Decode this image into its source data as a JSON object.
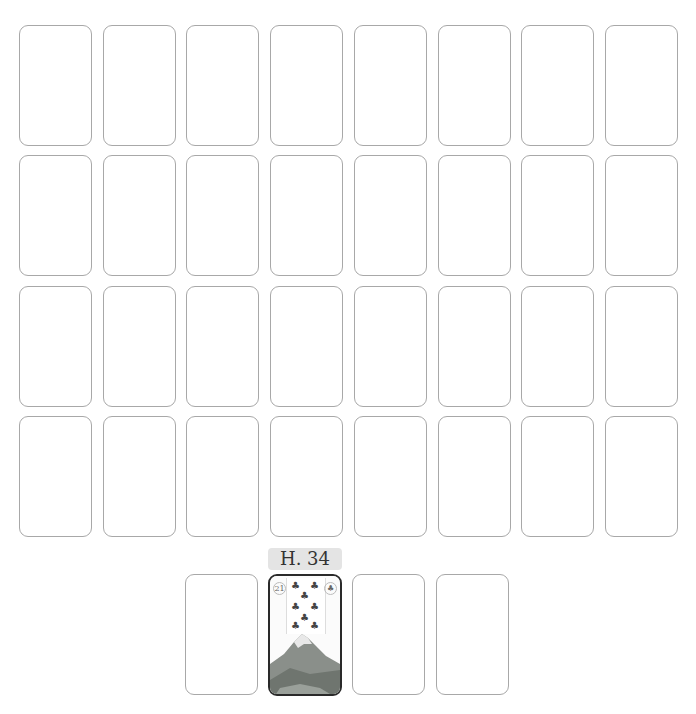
{
  "board": {
    "rows": 4,
    "columns": 8,
    "card_state": "face-down-empty"
  },
  "hand": {
    "slots": 4,
    "selected_index": 1,
    "selected_label": "H. 34",
    "selected_card": {
      "corner_number": "21",
      "corner_symbol": "club",
      "suit": "clubs",
      "rank": "7",
      "image": "mountain"
    }
  },
  "colors": {
    "card_border": "#a8a8a8",
    "selected_border": "#2a2a2a",
    "label_bg": "#e4e4e4"
  }
}
